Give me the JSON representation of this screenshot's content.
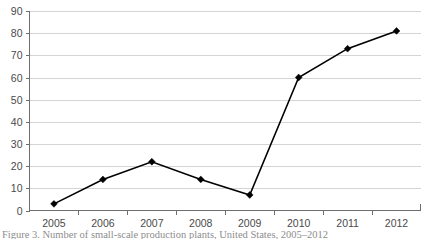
{
  "caption": {
    "text": "Figure 3. Number of small-scale production plants, United States, 2005–2012"
  },
  "chart_data": {
    "type": "line",
    "title": "",
    "subtitle": "",
    "xlabel": "",
    "ylabel": "",
    "categories": [
      "2005",
      "2006",
      "2007",
      "2008",
      "2009",
      "2010",
      "2011",
      "2012"
    ],
    "values": [
      3,
      14,
      22,
      14,
      7,
      60,
      73,
      81
    ],
    "series": [
      {
        "name": "Series 1",
        "values": [
          3,
          14,
          22,
          14,
          7,
          60,
          73,
          81
        ],
        "color": "#000000",
        "marker": "diamond"
      }
    ],
    "ylim": [
      0,
      90
    ],
    "ytick_step": 10,
    "y_tick_labels": [
      "0",
      "10",
      "20",
      "30",
      "40",
      "50",
      "60",
      "70",
      "80",
      "90"
    ],
    "x_tick_labels": [
      "2005",
      "2006",
      "2007",
      "2008",
      "2009",
      "2010",
      "2011",
      "2012"
    ],
    "grid": true,
    "grid_axis": "y",
    "grid_color": "#c9c9c9",
    "axis_color": "#6e6e6e",
    "legend": false,
    "legend_position": "none",
    "background": "#ffffff"
  }
}
